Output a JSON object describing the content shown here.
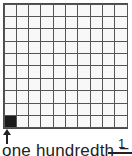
{
  "diagram": {
    "grid": {
      "rows": 10,
      "cols": 10,
      "filled_cell": {
        "row": 10,
        "col": 1
      },
      "fill_color": "#1a1a1a"
    },
    "label": "one hundredth =",
    "fraction_numerator": "1"
  }
}
